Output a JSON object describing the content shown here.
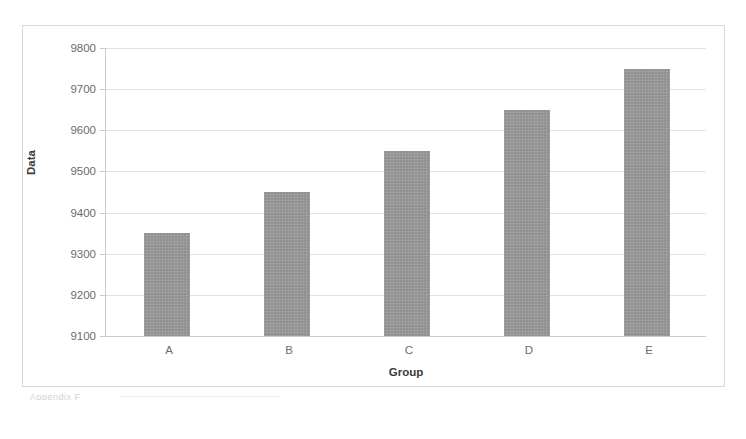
{
  "chart_data": {
    "type": "bar",
    "title": "",
    "xlabel": "Group",
    "ylabel": "Data",
    "categories": [
      "A",
      "B",
      "C",
      "D",
      "E"
    ],
    "values": [
      9350,
      9450,
      9550,
      9650,
      9750
    ],
    "ylim": [
      9100,
      9800
    ],
    "yticks": [
      9100,
      9200,
      9300,
      9400,
      9500,
      9600,
      9700,
      9800
    ],
    "ytick_labels": [
      "9100",
      "9200",
      "9300",
      "9400",
      "9500",
      "9600",
      "9700",
      "9800"
    ],
    "grid": true,
    "legend": null,
    "bar_color": "#9b9b9b",
    "grid_color": "#e2e2e2",
    "axis_color": "#c9c9c9",
    "frame_color": "#d8d8d8",
    "background": "#ffffff"
  },
  "figure": {
    "yaxis_title": "Data",
    "xaxis_title": "Group",
    "footer_note": "Appendix F"
  }
}
